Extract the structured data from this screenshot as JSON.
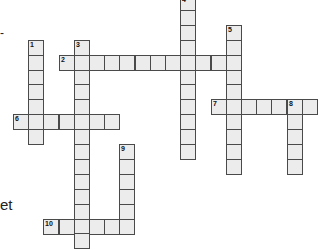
{
  "puzzle": {
    "type": "crossword",
    "cell_pitch_px": 15.2,
    "origin_x": 13,
    "origin_y": -5,
    "row_pitch_px": 14.9,
    "colors": {
      "cell_fill": "#ececec",
      "cell_border": "#4a4a4a",
      "background": "#ffffff"
    },
    "words": [
      {
        "number": "1",
        "direction": "down",
        "col": 1,
        "row": 3,
        "length": 7
      },
      {
        "number": "2",
        "direction": "across",
        "col": 3,
        "row": 4,
        "length": 12
      },
      {
        "number": "3",
        "direction": "down",
        "col": 4,
        "row": 3,
        "length": 14
      },
      {
        "number": "4",
        "direction": "down",
        "col": 11,
        "row": 0,
        "length": 11
      },
      {
        "number": "5",
        "direction": "down",
        "col": 14,
        "row": 2,
        "length": 10
      },
      {
        "number": "6",
        "direction": "across",
        "col": 0,
        "row": 8,
        "length": 7
      },
      {
        "number": "7",
        "direction": "across",
        "col": 13,
        "row": 7,
        "length": 7
      },
      {
        "number": "8",
        "direction": "down",
        "col": 18,
        "row": 7,
        "length": 5
      },
      {
        "number": "9",
        "direction": "down",
        "col": 7,
        "row": 10,
        "length": 6
      },
      {
        "number": "10",
        "direction": "across",
        "col": 2,
        "row": 15,
        "length": 6
      }
    ]
  },
  "clue_fragments": {
    "top_left": "-",
    "bottom_left": "et"
  }
}
